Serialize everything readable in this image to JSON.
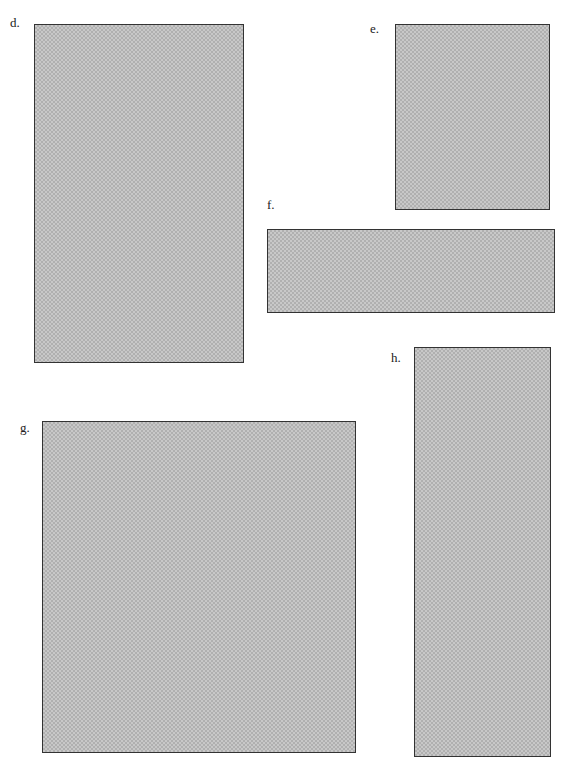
{
  "figure": {
    "panels": [
      {
        "id": "d",
        "label": "d.",
        "shape": "rectangle",
        "orientation": "portrait",
        "x": 34,
        "y": 24,
        "width": 210,
        "height": 339
      },
      {
        "id": "e",
        "label": "e.",
        "shape": "rectangle",
        "orientation": "portrait",
        "x": 395,
        "y": 24,
        "width": 155,
        "height": 186
      },
      {
        "id": "f",
        "label": "f.",
        "shape": "rectangle",
        "orientation": "landscape",
        "x": 267,
        "y": 229,
        "width": 288,
        "height": 84
      },
      {
        "id": "g",
        "label": "g.",
        "shape": "rectangle",
        "orientation": "portrait",
        "x": 42,
        "y": 421,
        "width": 314,
        "height": 332
      },
      {
        "id": "h",
        "label": "h.",
        "shape": "rectangle",
        "orientation": "portrait",
        "x": 414,
        "y": 347,
        "width": 137,
        "height": 408
      }
    ],
    "fill": "halftone gray pattern",
    "border_color": "#333333"
  }
}
